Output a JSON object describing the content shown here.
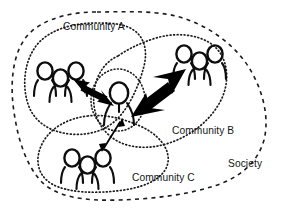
{
  "diagram": {
    "type": "concept-diagram",
    "canvas": {
      "width": 282,
      "height": 211,
      "background": "#ffffff"
    },
    "ink_color": "#141414",
    "labels": {
      "society": "Society",
      "community_a": "Community A",
      "community_b": "Community B",
      "community_c": "Community C"
    },
    "boundaries": [
      {
        "id": "society",
        "label": "Society",
        "style": "dashed",
        "label_position": {
          "x": 228,
          "y": 167
        }
      },
      {
        "id": "community-a",
        "label": "Community A",
        "style": "dotted",
        "label_position": {
          "x": 63,
          "y": 30
        }
      },
      {
        "id": "community-b",
        "label": "Community B",
        "style": "dotted",
        "label_position": {
          "x": 172,
          "y": 134
        }
      },
      {
        "id": "community-c",
        "label": "Community C",
        "style": "dotted",
        "label_position": {
          "x": 132,
          "y": 181
        }
      },
      {
        "id": "individual",
        "label": "",
        "style": "dotted",
        "label_position": null
      }
    ],
    "actors": [
      {
        "id": "group-a",
        "kind": "people-group",
        "count": 3,
        "community": "Community A"
      },
      {
        "id": "group-b",
        "kind": "people-group",
        "count": 3,
        "community": "Community B"
      },
      {
        "id": "group-c",
        "kind": "people-group",
        "count": 3,
        "community": "Community C"
      },
      {
        "id": "individual",
        "kind": "person-single",
        "count": 1,
        "community": "center"
      }
    ],
    "relations": [
      {
        "id": "link-a",
        "from": "individual",
        "to": "group-a",
        "weight": "medium",
        "bidirectional": true
      },
      {
        "id": "link-b",
        "from": "individual",
        "to": "group-b",
        "weight": "strong",
        "bidirectional": true
      },
      {
        "id": "link-c",
        "from": "individual",
        "to": "group-c",
        "weight": "weak",
        "bidirectional": true
      }
    ]
  }
}
